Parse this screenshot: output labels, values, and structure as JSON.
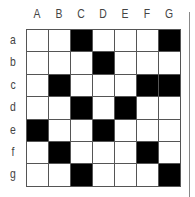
{
  "columns": [
    "A",
    "B",
    "C",
    "D",
    "E",
    "F",
    "G"
  ],
  "rows": [
    "a",
    "b",
    "c",
    "d",
    "e",
    "f",
    "g"
  ],
  "colors": {
    "filled": "#000000",
    "empty": "#ffffff",
    "line": "#555555"
  },
  "grid": [
    [
      0,
      0,
      1,
      0,
      0,
      0,
      1
    ],
    [
      0,
      0,
      0,
      1,
      0,
      0,
      0
    ],
    [
      0,
      1,
      0,
      0,
      0,
      1,
      1
    ],
    [
      0,
      0,
      1,
      0,
      1,
      0,
      0
    ],
    [
      1,
      0,
      0,
      1,
      0,
      0,
      0
    ],
    [
      0,
      1,
      0,
      0,
      0,
      1,
      0
    ],
    [
      0,
      0,
      1,
      0,
      0,
      0,
      1
    ]
  ]
}
